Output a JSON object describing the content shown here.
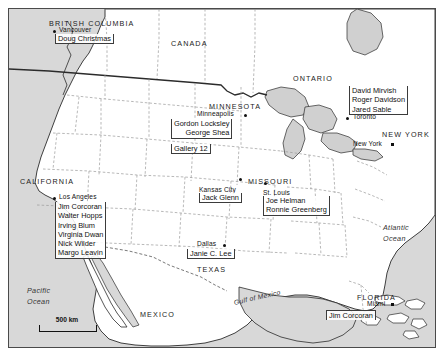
{
  "regions": [
    {
      "name": "BRITISH COLUMBIA",
      "x": 48,
      "y": 18
    },
    {
      "name": "CANADA",
      "x": 170,
      "y": 38
    },
    {
      "name": "ONTARIO",
      "x": 292,
      "y": 73
    },
    {
      "name": "MINNESOTA",
      "x": 208,
      "y": 101
    },
    {
      "name": "NEW YORK",
      "x": 381,
      "y": 129
    },
    {
      "name": "CALIFORNIA",
      "x": 19,
      "y": 176
    },
    {
      "name": "MISSOURI",
      "x": 247,
      "y": 176
    },
    {
      "name": "TEXAS",
      "x": 196,
      "y": 264
    },
    {
      "name": "MEXICO",
      "x": 139,
      "y": 309
    },
    {
      "name": "FLORIDA",
      "x": 356,
      "y": 292
    }
  ],
  "cities": [
    {
      "name": "Vancouver",
      "label_x": 58,
      "label_y": 27,
      "dot_x": 52,
      "dot_y": 29,
      "marker": "dot",
      "label_side": "right"
    },
    {
      "name": "Minneapolis",
      "label_x": 196,
      "label_y": 111,
      "dot_x": 243,
      "dot_y": 113,
      "marker": "dot",
      "label_side": "left"
    },
    {
      "name": "Toronto",
      "label_x": 352,
      "label_y": 114,
      "dot_x": 345,
      "dot_y": 116,
      "marker": "dot",
      "label_side": "right"
    },
    {
      "name": "New York",
      "label_x": 352,
      "label_y": 141,
      "dot_x": 390,
      "dot_y": 142,
      "marker": "square",
      "label_side": "left"
    },
    {
      "name": "Kansas City",
      "label_x": 198,
      "label_y": 185,
      "dot_x": 238,
      "dot_y": 177,
      "marker": "dot",
      "label_side": "left"
    },
    {
      "name": "St. Louis",
      "label_x": 262,
      "label_y": 188,
      "dot_x": 263,
      "dot_y": 181,
      "marker": "dot",
      "label_side": "right"
    },
    {
      "name": "Los Angeles",
      "label_x": 58,
      "label_y": 194,
      "dot_x": 52,
      "dot_y": 196,
      "marker": "dot",
      "label_side": "right"
    },
    {
      "name": "Dallas",
      "label_x": 196,
      "label_y": 241,
      "dot_x": 222,
      "dot_y": 243,
      "marker": "dot",
      "label_side": "left"
    },
    {
      "name": "Miami",
      "label_x": 366,
      "label_y": 301,
      "dot_x": 390,
      "dot_y": 303,
      "marker": "square",
      "label_side": "left"
    }
  ],
  "dealer_groups": [
    {
      "id": "vancouver-dealers",
      "city": "Vancouver",
      "names": [
        "Doug Christmas"
      ],
      "x": 54,
      "y": 33,
      "rule": "underline"
    },
    {
      "id": "minneapolis-dealers",
      "city": "Minneapolis",
      "names": [
        "Gordon Locksley",
        "George Shea"
      ],
      "x": 170,
      "y": 118,
      "rule": "underline"
    },
    {
      "id": "minneapolis-gallery",
      "city": "Minneapolis",
      "names": [
        "Gallery 12"
      ],
      "x": 170,
      "y": 143,
      "rule": "underline"
    },
    {
      "id": "toronto-dealers",
      "city": "Toronto",
      "names": [
        "David Mirvish",
        "Roger Davidson",
        "Jared Sable"
      ],
      "x": 348,
      "y": 85,
      "rule": "underline"
    },
    {
      "id": "kansas-city-dealers",
      "city": "Kansas City",
      "names": [
        "Jack Glenn"
      ],
      "x": 198,
      "y": 192,
      "rule": "underline"
    },
    {
      "id": "st-louis-dealers",
      "city": "St. Louis",
      "names": [
        "Joe Helman",
        "Ronnie Greenberg"
      ],
      "x": 262,
      "y": 195,
      "rule": "underline"
    },
    {
      "id": "los-angeles-dealers",
      "city": "Los Angeles",
      "names": [
        "Jim Corcoran",
        "Walter Hopps",
        "Irving Blum",
        "Virginia Dwan",
        "Nick Wilder",
        "Margo Leavin"
      ],
      "x": 54,
      "y": 201,
      "rule": "underline"
    },
    {
      "id": "dallas-dealers",
      "city": "Dallas",
      "names": [
        "Janie C. Lee"
      ],
      "x": 186,
      "y": 248,
      "rule": "underline"
    },
    {
      "id": "miami-dealers",
      "city": "Miami",
      "names": [
        "Jim Corcoran"
      ],
      "x": 325,
      "y": 308,
      "rule": "overline"
    }
  ],
  "water_labels": [
    {
      "name": "Pacific",
      "x": 26,
      "y": 285,
      "type": "ocean",
      "second_line": "Ocean"
    },
    {
      "name": "Atlantic",
      "x": 382,
      "y": 222,
      "type": "ocean",
      "second_line": "Ocean"
    },
    {
      "name": "Gulf of Mexico",
      "x": 233,
      "y": 295,
      "type": "gulf"
    }
  ],
  "scale_bar": {
    "label": "500 km",
    "length_px": 56
  },
  "colors": {
    "land": "#ffffff",
    "water": "#d8d8d8",
    "border_line": "#4a4a4a",
    "state_line": "#9a9a9a",
    "country_line": "#2b2b2b",
    "text": "#111111",
    "label_rule": "#3b3b3b"
  }
}
